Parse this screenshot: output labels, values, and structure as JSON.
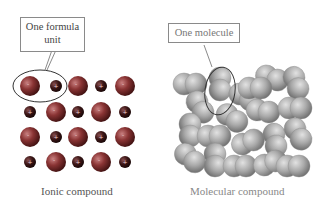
{
  "left_panel": {
    "callout_line1": "One formula",
    "callout_line2": "unit",
    "caption": "Ionic compound",
    "grid": {
      "rows": 4,
      "cols": 5,
      "pattern": [
        [
          "large",
          "small",
          "large",
          "small",
          "large"
        ],
        [
          "small",
          "large",
          "small",
          "large",
          "small"
        ],
        [
          "large",
          "small",
          "large",
          "small",
          "large"
        ],
        [
          "small",
          "large",
          "small",
          "large",
          "small"
        ]
      ],
      "large_ion_label": "-",
      "small_ion_label": "+"
    }
  },
  "right_panel": {
    "callout": "One molecule",
    "caption": "Molecular compound",
    "molecule_count": 20
  },
  "colors": {
    "ion_large": "#7a2c2c",
    "ion_small": "#3a1414",
    "molecule": "#a8a8a8",
    "outline": "#333333",
    "callout_border": "#8a8a8a"
  }
}
